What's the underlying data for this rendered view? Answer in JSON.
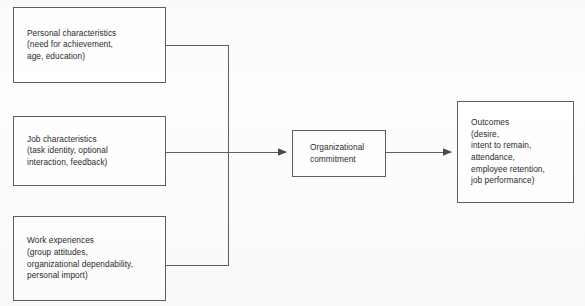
{
  "diagram": {
    "type": "flowchart",
    "stroke_color": "#5e5e5e",
    "text_color": "#2b2b2b",
    "background_color": "#fdfdfb",
    "nodes": [
      {
        "id": "personal-characteristics",
        "text": "Personal characteristics\n(need for achievement,\nage, education)",
        "x": 13,
        "y": 7,
        "w": 153,
        "h": 76
      },
      {
        "id": "job-characteristics",
        "text": "Job characteristics\n(task identity, optional\ninteraction, feedback)",
        "x": 13,
        "y": 116,
        "w": 153,
        "h": 70
      },
      {
        "id": "work-experiences",
        "text": "Work experiences\n(group attitudes,\norganizational dependability,\npersonal import)",
        "x": 13,
        "y": 216,
        "w": 153,
        "h": 85
      },
      {
        "id": "organizational-commitment",
        "text": "Organizational\ncommitment",
        "x": 292,
        "y": 130,
        "w": 94,
        "h": 47
      },
      {
        "id": "outcomes",
        "text": "Outcomes\n(desire,\nintent to remain,\nattendance,\nemployee retention,\njob performance)",
        "x": 457,
        "y": 101,
        "w": 117,
        "h": 102
      }
    ],
    "edges": [
      {
        "id": "edge-personal-to-commitment",
        "from": "personal-characteristics",
        "to": "organizational-commitment",
        "path": "M166 45 L228 45 L228 152",
        "arrow": false
      },
      {
        "id": "edge-work-to-commitment",
        "from": "work-experiences",
        "to": "organizational-commitment",
        "path": "M166 265 L228 265 L228 152",
        "arrow": false
      },
      {
        "id": "edge-job-to-commitment",
        "from": "job-characteristics",
        "to": "organizational-commitment",
        "path": "M166 152 L286 152",
        "arrow": true,
        "arrow_points": "286,152 278,148.6 278,155.4"
      },
      {
        "id": "edge-commitment-to-outcomes",
        "from": "organizational-commitment",
        "to": "outcomes",
        "path": "M386 152 L451 152",
        "arrow": true,
        "arrow_points": "451,152 443,148.6 443,155.4"
      }
    ]
  }
}
